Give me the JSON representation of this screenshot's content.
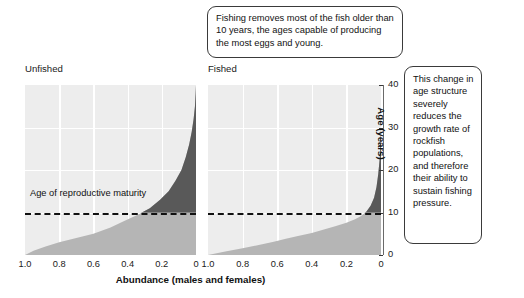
{
  "figure": {
    "panels": [
      {
        "id": "unfished",
        "label": "Unfished"
      },
      {
        "id": "fished",
        "label": "Fished"
      }
    ],
    "callout_top": "Fishing removes most of the fish older than 10  years, the ages capable of producing the most eggs and young.",
    "callout_right": "This change in age structure severely reduces the growth rate of rockfish populations, and therefore their ability to sustain fishing pressure.",
    "maturity_label": "Age of reproductive maturity",
    "colors": {
      "plot_background": "#ededed",
      "gridline": "#ffffff",
      "immature_fill": "#b5b5b5",
      "mature_fill": "#595959",
      "dashed_line": "#111111",
      "callout_border": "#3a3a3a"
    }
  },
  "chart_data": {
    "type": "area",
    "title": "",
    "xlabel": "Abundance (males and females)",
    "ylabel": "Age (years)",
    "ylim": [
      0,
      40
    ],
    "xlim": [
      1.0,
      0.0
    ],
    "x_reversed": true,
    "grid": true,
    "legend_position": "none",
    "yticks": [
      0,
      10,
      20,
      30,
      40
    ],
    "xticks": [
      "1.0",
      "0.8",
      "0.6",
      "0.4",
      "0.2",
      "0"
    ],
    "annotations": [
      {
        "text": "Age of reproductive maturity",
        "type": "hline",
        "y": 10,
        "style": "dashed"
      }
    ],
    "series": [
      {
        "name": "Unfished",
        "panel": "unfished",
        "description": "Abundance declines steeply with age; substantial numbers of fish persist well above age 10, tapering to age 40.",
        "x": [
          1.0,
          0.95,
          0.88,
          0.8,
          0.7,
          0.6,
          0.5,
          0.42,
          0.34,
          0.27,
          0.21,
          0.16,
          0.12,
          0.085,
          0.06,
          0.04,
          0.025,
          0.014,
          0.006,
          0.002,
          0.0
        ],
        "y": [
          0,
          1,
          2,
          3,
          4,
          5,
          6.5,
          8,
          9.5,
          11,
          13,
          15,
          17.5,
          20,
          23,
          26,
          29,
          32,
          35,
          38,
          40
        ],
        "mature_threshold_age": 10
      },
      {
        "name": "Fished",
        "panel": "fished",
        "description": "Abundance above age 10 is nearly eliminated; only a thin remnant of older fish remains near zero abundance.",
        "x": [
          1.0,
          0.9,
          0.8,
          0.7,
          0.62,
          0.55,
          0.48,
          0.4,
          0.33,
          0.26,
          0.2,
          0.15,
          0.115,
          0.085,
          0.06,
          0.04,
          0.026,
          0.016,
          0.008,
          0.003,
          0.0
        ],
        "y": [
          0,
          0.8,
          1.6,
          2.4,
          3.1,
          3.8,
          4.5,
          5.2,
          6.0,
          6.8,
          7.6,
          8.4,
          9.2,
          10.2,
          11.6,
          13.5,
          16.0,
          19.0,
          22.5,
          26.0,
          30.0
        ],
        "mature_threshold_age": 10
      }
    ]
  }
}
